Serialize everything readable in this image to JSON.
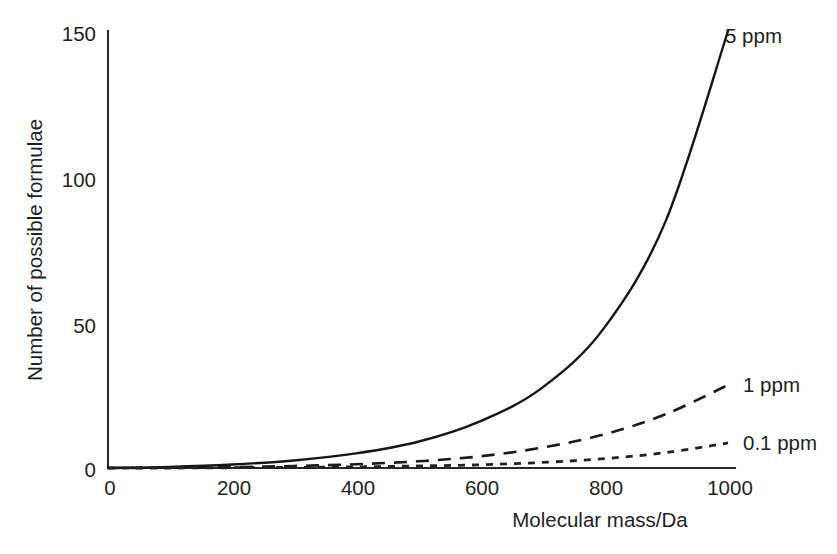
{
  "chart_data": {
    "type": "line",
    "title": "",
    "xlabel": "Molecular mass/Da",
    "ylabel": "Number of possible formulae",
    "xlim": [
      0,
      1000
    ],
    "ylim": [
      0,
      150
    ],
    "xticks": [
      "0",
      "200",
      "400",
      "600",
      "800",
      "1000"
    ],
    "xtick_values": [
      0,
      200,
      400,
      600,
      800,
      1000
    ],
    "yticks": [
      "0",
      "50",
      "100",
      "150"
    ],
    "ytick_values": [
      0,
      50,
      100,
      150
    ],
    "grid": false,
    "legend_position": "right-inline-labels",
    "x": [
      0,
      100,
      200,
      300,
      400,
      500,
      600,
      700,
      800,
      900,
      1000
    ],
    "series": [
      {
        "name": "5 ppm",
        "label": "5 ppm",
        "style": "solid",
        "color": "#151515",
        "values": [
          0,
          0.4,
          1.2,
          2.6,
          5.0,
          9.0,
          16.0,
          27.5,
          48.0,
          85.0,
          150.0
        ]
      },
      {
        "name": "1 ppm",
        "label": "1 ppm",
        "style": "dashed",
        "color": "#1a1a1a",
        "values": [
          0,
          0.1,
          0.3,
          0.7,
          1.3,
          2.3,
          4.0,
          7.0,
          11.5,
          18.5,
          28.5
        ]
      },
      {
        "name": "0.1 ppm",
        "label": "0.1 ppm",
        "style": "dotted",
        "color": "#222222",
        "values": [
          0,
          0.0,
          0.1,
          0.2,
          0.4,
          0.7,
          1.1,
          1.9,
          3.2,
          5.3,
          8.6
        ]
      }
    ]
  },
  "axes": {
    "y_label_text": "Number of possible formulae",
    "x_label_text": "Molecular mass/Da"
  },
  "annotations": {
    "label_5ppm": "5 ppm",
    "label_1ppm": "1 ppm",
    "label_01ppm": "0.1 ppm"
  },
  "colors": {
    "background": "#ffffff",
    "axis": "#2a2a2a",
    "text": "#1f1f1f",
    "series_solid": "#151515",
    "series_dashed": "#1a1a1a",
    "series_dotted": "#222222"
  }
}
